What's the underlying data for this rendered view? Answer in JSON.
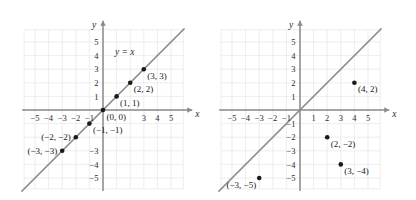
{
  "figure": {
    "background_color": "#ffffff",
    "grid_color": "#e8e8ec",
    "axis_color": "#8a8a8a",
    "line_color": "#8f8f8f",
    "point_color": "#1a1a1a"
  },
  "chart_data": [
    {
      "type": "scatter",
      "panel": "left",
      "title": "",
      "xlabel": "x",
      "ylabel": "y",
      "xlim": [
        -6,
        6
      ],
      "ylim": [
        -6,
        6
      ],
      "grid": true,
      "x_ticks": [
        -5,
        -4,
        -3,
        -2,
        -1,
        3,
        4,
        5
      ],
      "x_tick_labels": [
        "-5",
        "-4",
        "-3",
        "-2",
        "-1",
        "3",
        "4",
        "5"
      ],
      "y_ticks": [
        5,
        4,
        3,
        2,
        1,
        -3,
        -4,
        -5
      ],
      "y_tick_labels": [
        "5",
        "4",
        "3",
        "2",
        "1",
        "-3",
        "-4",
        "-5"
      ],
      "annotations": [
        {
          "text": "y = x",
          "x": 1.6,
          "y": 4.05
        }
      ],
      "series": [
        {
          "name": "y = x",
          "kind": "line",
          "x": [
            -6,
            6
          ],
          "values": [
            -6,
            6
          ]
        },
        {
          "name": "plotted points",
          "kind": "points",
          "points": [
            {
              "x": -3,
              "y": -3,
              "label": "(-3, -3)",
              "label_pos": "left"
            },
            {
              "x": -2,
              "y": -2,
              "label": "(-2, -2)",
              "label_pos": "left"
            },
            {
              "x": -1,
              "y": -1,
              "label": "(-1, -1)",
              "label_pos": "below-right"
            },
            {
              "x": 0,
              "y": 0,
              "label": "(0, 0)",
              "label_pos": "below-right"
            },
            {
              "x": 1,
              "y": 1,
              "label": "(1, 1)",
              "label_pos": "below-right"
            },
            {
              "x": 2,
              "y": 2,
              "label": "(2, 2)",
              "label_pos": "below-right"
            },
            {
              "x": 3,
              "y": 3,
              "label": "(3, 3)",
              "label_pos": "below-right"
            }
          ]
        }
      ]
    },
    {
      "type": "scatter",
      "panel": "right",
      "title": "",
      "xlabel": "x",
      "ylabel": "y",
      "xlim": [
        -6,
        6
      ],
      "ylim": [
        -6,
        6
      ],
      "grid": true,
      "x_ticks": [
        -5,
        -4,
        -3,
        -2,
        -1,
        1,
        2,
        3,
        4,
        5
      ],
      "x_tick_labels": [
        "-5",
        "-4",
        "-3",
        "-2",
        "-1",
        "1",
        "2",
        "3",
        "4",
        "5"
      ],
      "y_ticks": [
        5,
        4,
        3,
        2,
        1,
        -1,
        -2,
        -3,
        -4,
        -5
      ],
      "y_tick_labels": [
        "5",
        "4",
        "3",
        "2",
        "1",
        "-1",
        "-2",
        "-3",
        "-4",
        "-5"
      ],
      "annotations": [],
      "series": [
        {
          "name": "y = x",
          "kind": "line",
          "x": [
            -6,
            6
          ],
          "values": [
            -6,
            6
          ]
        },
        {
          "name": "plotted points",
          "kind": "points",
          "points": [
            {
              "x": 4,
              "y": 2,
              "label": "(4, 2)",
              "label_pos": "below-right"
            },
            {
              "x": 2,
              "y": -2,
              "label": "(2, -2)",
              "label_pos": "below-right"
            },
            {
              "x": 3,
              "y": -4,
              "label": "(3, -4)",
              "label_pos": "below-right"
            },
            {
              "x": -3,
              "y": -5,
              "label": "(-3, -5)",
              "label_pos": "below-left"
            }
          ]
        }
      ]
    }
  ]
}
